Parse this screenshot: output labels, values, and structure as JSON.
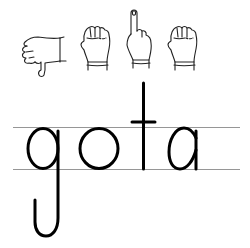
{
  "worksheet": {
    "word": "gota",
    "letters": [
      "g",
      "o",
      "t",
      "a"
    ],
    "signs": [
      {
        "letter": "g",
        "icon": "hand-sign-g-icon",
        "description": "thumb pointing down"
      },
      {
        "letter": "o",
        "icon": "hand-sign-o-icon",
        "description": "closed fist"
      },
      {
        "letter": "t",
        "icon": "hand-sign-t-icon",
        "description": "index finger pointing up"
      },
      {
        "letter": "a",
        "icon": "hand-sign-a-icon",
        "description": "closed fist"
      }
    ],
    "colors": {
      "ink": "#000000",
      "guideline": "#8a8a8a",
      "background": "#ffffff"
    }
  }
}
